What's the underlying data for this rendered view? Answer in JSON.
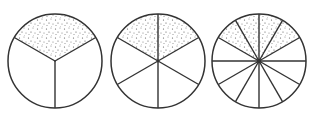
{
  "diagram": {
    "stroke_color": "#333333",
    "shade_dot_color": "#555555",
    "background": "#ffffff",
    "circles": [
      {
        "id": "thirds",
        "cx": 55,
        "cy": 61,
        "r": 47,
        "parts": 3,
        "shaded": 1,
        "fraction": "1/3"
      },
      {
        "id": "sixths",
        "cx": 158,
        "cy": 61,
        "r": 47,
        "parts": 6,
        "shaded": 2,
        "fraction": "2/6"
      },
      {
        "id": "twelfths",
        "cx": 259,
        "cy": 61,
        "r": 47,
        "parts": 12,
        "shaded": 4,
        "fraction": "4/12"
      }
    ]
  }
}
